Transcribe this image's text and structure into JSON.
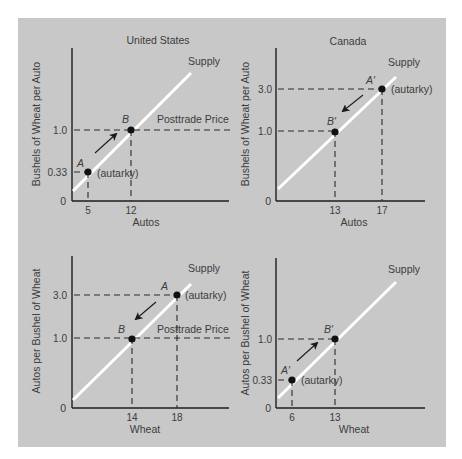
{
  "colors": {
    "panel_background": "#c8c8c8",
    "supply_line": "#ffffff",
    "axis": "#1e1e1e",
    "text": "#3c3c3c"
  },
  "panels": {
    "us_autos": {
      "title": "United States",
      "ylabel": "Bushels of Wheat per Auto",
      "xlabel": "Autos",
      "origin_label": "0",
      "y_ticks": [
        "1.0",
        "0.33"
      ],
      "x_ticks": [
        "5",
        "12"
      ],
      "curve_label": "Supply",
      "point_a_label": "A",
      "point_a_note": "(autarky)",
      "point_b_label": "B",
      "price_line_label": "Posttrade Price"
    },
    "canada_autos": {
      "title": "Canada",
      "ylabel": "Bushels of Wheat per Auto",
      "xlabel": "Autos",
      "origin_label": "0",
      "y_ticks": [
        "3.0",
        "1.0"
      ],
      "x_ticks": [
        "13",
        "17"
      ],
      "curve_label": "Supply",
      "point_a_label": "A′",
      "point_a_note": "(autarky)",
      "point_b_label": "B′"
    },
    "us_wheat": {
      "ylabel": "Autos per Bushel of Wheat",
      "xlabel": "Wheat",
      "origin_label": "0",
      "y_ticks": [
        "3.0",
        "1.0"
      ],
      "x_ticks": [
        "14",
        "18"
      ],
      "curve_label": "Supply",
      "point_a_label": "A",
      "point_a_note": "(autarky)",
      "point_b_label": "B",
      "price_line_label": "Posttrade Price"
    },
    "canada_wheat": {
      "ylabel": "Autos per Bushel of Wheat",
      "xlabel": "Wheat",
      "origin_label": "0",
      "y_ticks": [
        "1.0",
        "0.33"
      ],
      "x_ticks": [
        "6",
        "13"
      ],
      "curve_label": "Supply",
      "point_a_label": "A′",
      "point_a_note": "(autarky)",
      "point_b_label": "B′"
    }
  }
}
